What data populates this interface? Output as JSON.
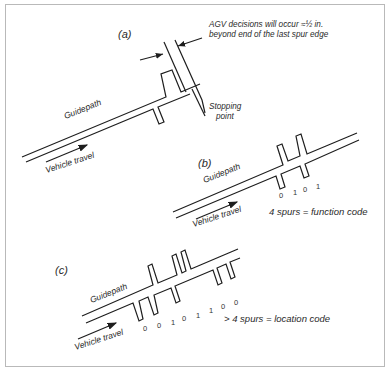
{
  "figure": {
    "panels": [
      {
        "id": "a",
        "label": "(a)",
        "guidepath_label": "Guidepath",
        "travel_label": "Vehicle travel",
        "annotation_line1": "AGV decisions will occur ≈½ in.",
        "annotation_line2": "beyond end of the last spur edge",
        "stopping_line1": "Stopping",
        "stopping_line2": "point"
      },
      {
        "id": "b",
        "label": "(b)",
        "guidepath_label": "Guidepath",
        "travel_label": "Vehicle travel",
        "bits": [
          "0",
          "1",
          "0",
          "1"
        ],
        "caption": "4 spurs = function code"
      },
      {
        "id": "c",
        "label": "(c)",
        "guidepath_label": "Guidepath",
        "travel_label": "Vehicle travel",
        "bits": [
          "0",
          "0",
          "1",
          "0",
          "1",
          "1",
          "0",
          "0"
        ],
        "caption": "> 4 spurs = location code"
      }
    ],
    "colors": {
      "line": "#1e1e1e",
      "border": "#b9b9b9",
      "text": "#2a2a2a"
    }
  }
}
